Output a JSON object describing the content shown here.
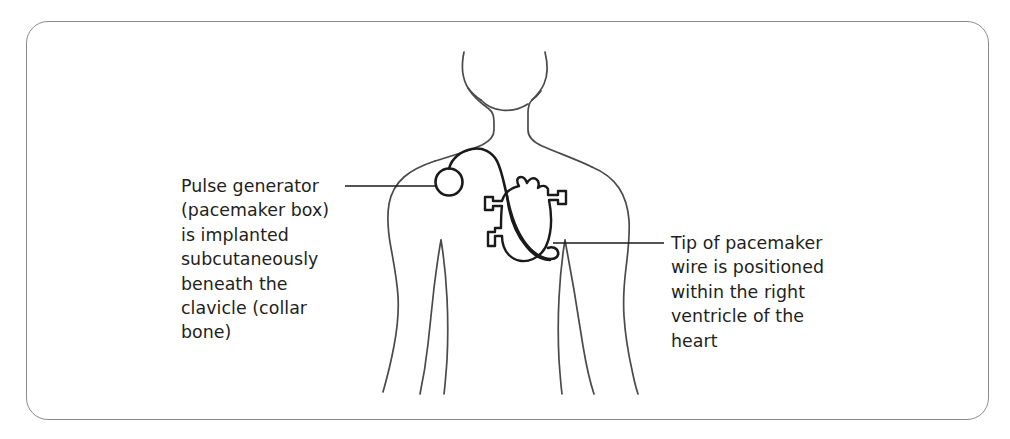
{
  "figure": {
    "type": "medical-illustration",
    "background_color": "#ffffff",
    "frame": {
      "border_color": "#8a8a8a",
      "corner_radius_px": 22
    },
    "line_color_body": "#4a4a4a",
    "line_color_device": "#1a1a1a",
    "text_color": "#231f20"
  },
  "callouts": {
    "left": {
      "text": "Pulse generator\n(pacemaker box)\nis implanted\nsubcutaneously\nbeneath the\nclavicle (collar\nbone)",
      "points_to": "pulse-generator-device"
    },
    "right": {
      "text": "Tip of pacemaker\nwire is positioned\nwithin the right\nventricle of the\nheart",
      "points_to": "pacemaker-wire-tip"
    }
  },
  "anatomy": {
    "parts": [
      "head-and-jaw",
      "neck",
      "shoulders",
      "torso",
      "left-arm",
      "right-arm",
      "heart"
    ]
  },
  "device": {
    "parts": [
      "pulse-generator",
      "pacemaker-lead-wire",
      "lead-tip-in-right-ventricle"
    ]
  }
}
